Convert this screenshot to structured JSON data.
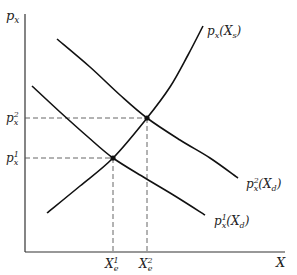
{
  "chart_data": {
    "type": "line",
    "title": "",
    "xlabel": "X",
    "ylabel": "p_x",
    "axis_labels": {
      "x": "X",
      "y": "p",
      "y_sub": "x"
    },
    "grid": false,
    "legend": "inline curve labels",
    "series": [
      {
        "name": "p_x(X_s)",
        "label_main": "p",
        "label_sub": "x",
        "label_arg": "(X",
        "label_arg_sub": "s",
        "label_close": ")",
        "kind": "supply",
        "points": [
          [
            47,
            213
          ],
          [
            80,
            186
          ],
          [
            113,
            158
          ],
          [
            147,
            118
          ],
          [
            170,
            87
          ],
          [
            188,
            55
          ],
          [
            203,
            26
          ]
        ]
      },
      {
        "name": "p_x^2(X_d)",
        "label_main": "p",
        "label_sup": "2",
        "label_sub": "x",
        "label_arg": "(X",
        "label_arg_sub": "d",
        "label_close": ")",
        "kind": "demand-high",
        "points": [
          [
            57,
            39
          ],
          [
            90,
            67
          ],
          [
            120,
            95
          ],
          [
            147,
            118
          ],
          [
            180,
            140
          ],
          [
            210,
            158
          ],
          [
            238,
            178
          ]
        ]
      },
      {
        "name": "p_x^1(X_d)",
        "label_main": "p",
        "label_sup": "1",
        "label_sub": "x",
        "label_arg": "(X",
        "label_arg_sub": "d",
        "label_close": ")",
        "kind": "demand-low",
        "points": [
          [
            32,
            86
          ],
          [
            60,
            112
          ],
          [
            88,
            137
          ],
          [
            113,
            158
          ],
          [
            145,
            178
          ],
          [
            175,
            196
          ],
          [
            205,
            215
          ]
        ]
      }
    ],
    "equilibria": [
      {
        "name": "E1",
        "x": 113,
        "y": 158,
        "x_label": "X",
        "x_label_sub": "e",
        "x_label_sup": "1",
        "p_label": "p",
        "p_label_sub": "x",
        "p_label_sup": "1"
      },
      {
        "name": "E2",
        "x": 147,
        "y": 118,
        "x_label": "X",
        "x_label_sub": "e",
        "x_label_sup": "2",
        "p_label": "p",
        "p_label_sub": "x",
        "p_label_sup": "2"
      }
    ],
    "annotations": [
      "p_x^1",
      "p_x^2",
      "X_e^1",
      "X_e^2"
    ]
  }
}
